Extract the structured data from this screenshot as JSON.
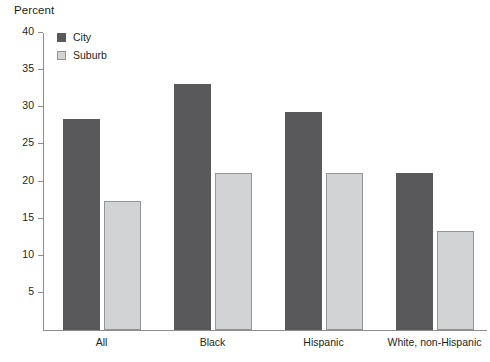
{
  "chart_data": {
    "type": "bar",
    "title": "",
    "xlabel": "",
    "ylabel": "Percent",
    "ylim": [
      0,
      40
    ],
    "ytick_step": 5,
    "yticks": [
      40,
      35,
      30,
      25,
      20,
      15,
      10,
      5
    ],
    "grid": false,
    "legend_position": "top-left",
    "categories": [
      "All",
      "Black",
      "Hispanic",
      "White, non-Hispanic"
    ],
    "series": [
      {
        "name": "City",
        "color": "#59585a",
        "values": [
          28.4,
          33.2,
          29.3,
          21.1
        ]
      },
      {
        "name": "Suburb",
        "color": "#d2d3d4",
        "values": [
          17.4,
          21.2,
          21.2,
          13.3
        ]
      }
    ]
  },
  "axis": {
    "y_title": "Percent",
    "tick_labels": [
      "40",
      "35",
      "30",
      "25",
      "20",
      "15",
      "10",
      "5"
    ]
  },
  "legend": {
    "items": [
      {
        "label": "City",
        "swatch": "legend-swatch-city"
      },
      {
        "label": "Suburb",
        "swatch": "legend-swatch-suburb"
      }
    ]
  },
  "categories": {
    "labels": [
      "All",
      "Black",
      "Hispanic",
      "White, non-Hispanic"
    ]
  }
}
